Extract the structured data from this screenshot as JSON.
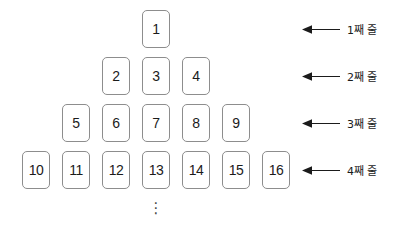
{
  "figure": {
    "background_color": "#ffffff",
    "card_border_color": "#8d8d8d",
    "text_color": "#1b1b1b",
    "continuation_symbol": "⋮"
  },
  "pyramid": {
    "rows": [
      {
        "row_index": 1,
        "left": 142,
        "top": 10,
        "cards": [
          "1"
        ]
      },
      {
        "row_index": 2,
        "left": 102,
        "top": 57,
        "cards": [
          "2",
          "3",
          "4"
        ]
      },
      {
        "row_index": 3,
        "left": 62,
        "top": 104,
        "cards": [
          "5",
          "6",
          "7",
          "8",
          "9"
        ]
      },
      {
        "row_index": 4,
        "left": 22,
        "top": 151,
        "cards": [
          "10",
          "11",
          "12",
          "13",
          "14",
          "15",
          "16"
        ]
      }
    ]
  },
  "annotations": [
    {
      "top": 19,
      "arrow": "left-arrow",
      "label": "1째 줄"
    },
    {
      "top": 66,
      "arrow": "left-arrow",
      "label": "2째 줄"
    },
    {
      "top": 113,
      "arrow": "left-arrow",
      "label": "3째 줄"
    },
    {
      "top": 160,
      "arrow": "left-arrow",
      "label": "4째 줄"
    }
  ]
}
